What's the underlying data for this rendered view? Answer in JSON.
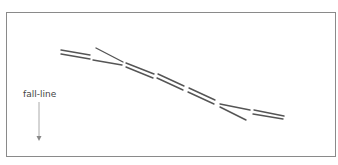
{
  "diagram": {
    "type": "ski-track-diagram",
    "label": "fall-line",
    "arrow_direction": "down",
    "colors": {
      "frame": "#8a8a8a",
      "tracks": "#555555",
      "arrow": "#aaaaaa",
      "label": "#444444"
    },
    "track_pairs": [
      {
        "a": [
          61,
          50,
          90,
          55
        ],
        "b": [
          61,
          54,
          90,
          59
        ]
      },
      {
        "a": [
          96,
          48,
          123,
          62
        ],
        "b": [
          93,
          60,
          122,
          65
        ]
      },
      {
        "a": [
          126,
          63,
          154,
          74
        ],
        "b": [
          126,
          67,
          153,
          78
        ]
      },
      {
        "a": [
          158,
          74,
          184,
          86
        ],
        "b": [
          157,
          78,
          183,
          90
        ]
      },
      {
        "a": [
          189,
          88,
          215,
          100
        ],
        "b": [
          188,
          92,
          214,
          104
        ]
      },
      {
        "a": [
          220,
          104,
          250,
          110
        ],
        "b": [
          220,
          107,
          246,
          120
        ]
      },
      {
        "a": [
          254,
          110,
          284,
          116
        ],
        "b": [
          253,
          114,
          283,
          119
        ]
      }
    ]
  }
}
